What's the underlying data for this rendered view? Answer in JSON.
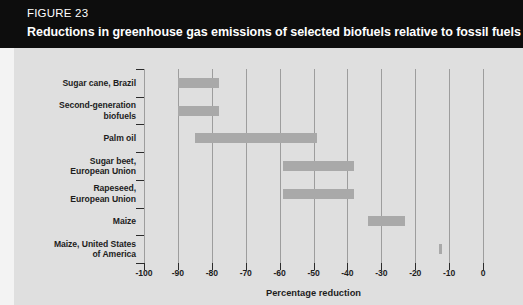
{
  "header": {
    "figure_number": "FIGURE 23",
    "title": "Reductions in greenhouse gas emissions of selected biofuels relative to fossil fuels"
  },
  "colors": {
    "header_background": "#0d0d0d",
    "header_text": "#ffffff",
    "plot_background": "#dfdfdf",
    "bar_fill": "#a9a9a9",
    "gridline": "#9d9d9d",
    "axis_text": "#1d1d1d"
  },
  "chart_data": {
    "type": "bar",
    "orientation": "horizontal",
    "title": "Reductions in greenhouse gas emissions of selected biofuels relative to fossil fuels",
    "xlabel": "Percentage reduction",
    "ylabel": "",
    "xlim": [
      -100,
      0
    ],
    "xticks": [
      -100,
      -90,
      -80,
      -70,
      -60,
      -50,
      -40,
      -30,
      -20,
      -10,
      0
    ],
    "xtick_labels": [
      "-100",
      "-90",
      "-80",
      "-70",
      "-60",
      "-50",
      "-40",
      "-30",
      "-20",
      "-10",
      "0"
    ],
    "grid": true,
    "legend": "none",
    "value_type": "range",
    "categories": [
      "Sugar cane, Brazil",
      "Second-generation biofuels",
      "Palm oil",
      "Sugar beet, European Union",
      "Rapeseed, European Union",
      "Maize",
      "Maize, United States of America"
    ],
    "ranges": [
      {
        "category": "Sugar cane, Brazil",
        "low": -90,
        "high": -78
      },
      {
        "category": "Second-generation biofuels",
        "low": -90,
        "high": -78
      },
      {
        "category": "Palm oil",
        "low": -85,
        "high": -49
      },
      {
        "category": "Sugar beet, European Union",
        "low": -59,
        "high": -38
      },
      {
        "category": "Rapeseed, European Union",
        "low": -59,
        "high": -38
      },
      {
        "category": "Maize",
        "low": -34,
        "high": -23
      },
      {
        "category": "Maize, United States of America",
        "low": -13,
        "high": -12
      }
    ]
  },
  "axis": {
    "category_labels": [
      "Sugar cane, Brazil",
      "Second-generation\nbiofuels",
      "Palm oil",
      "Sugar beet,\nEuropean Union",
      "Rapeseed,\nEuropean Union",
      "Maize",
      "Maize, United States\nof America"
    ],
    "x_title": "Percentage reduction"
  }
}
